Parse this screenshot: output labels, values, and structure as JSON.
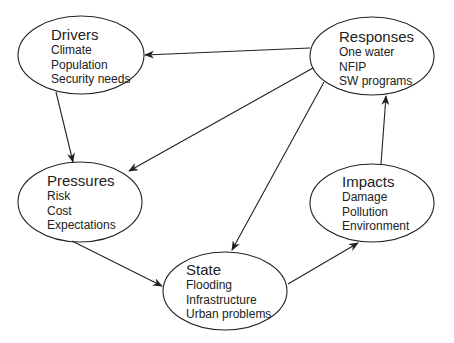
{
  "diagram": {
    "type": "DPSIR cycle",
    "nodes": [
      {
        "id": "drivers",
        "title": "Drivers",
        "items": [
          "Climate",
          "Population",
          "Security needs"
        ]
      },
      {
        "id": "responses",
        "title": "Responses",
        "items": [
          "One water",
          "NFIP",
          "SW programs"
        ]
      },
      {
        "id": "pressures",
        "title": "Pressures",
        "items": [
          "Risk",
          "Cost",
          "Expectations"
        ]
      },
      {
        "id": "impacts",
        "title": "Impacts",
        "items": [
          "Damage",
          "Pollution",
          "Environment"
        ]
      },
      {
        "id": "state",
        "title": "State",
        "items": [
          "Flooding",
          "Infrastructure",
          "Urban problems"
        ]
      }
    ],
    "edges": [
      {
        "from": "responses",
        "to": "drivers"
      },
      {
        "from": "responses",
        "to": "pressures"
      },
      {
        "from": "responses",
        "to": "state"
      },
      {
        "from": "drivers",
        "to": "pressures"
      },
      {
        "from": "pressures",
        "to": "state"
      },
      {
        "from": "state",
        "to": "impacts"
      },
      {
        "from": "impacts",
        "to": "responses"
      }
    ]
  }
}
